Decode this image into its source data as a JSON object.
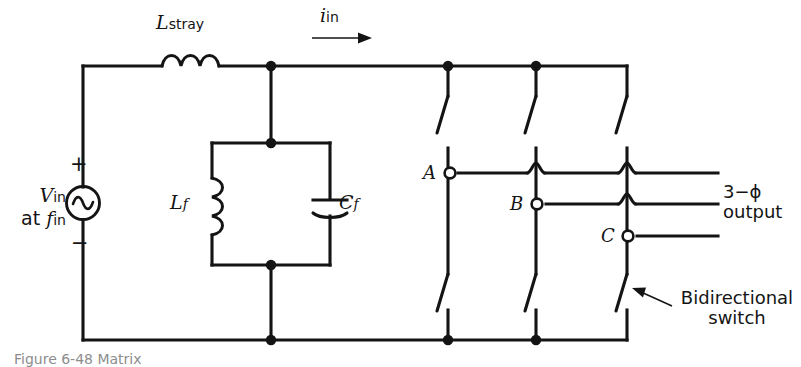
{
  "figure": {
    "caption_fragment": "Figure 6-48  Matrix",
    "background_color": "#ffffff",
    "ink_color": "#141414"
  },
  "source": {
    "symbol": "ac-source-sine",
    "voltage_label": "V",
    "voltage_subscript": "in",
    "frequency_prefix": "at",
    "frequency_label": "f",
    "frequency_subscript": "in",
    "plus_sign": "+",
    "minus_sign": "−"
  },
  "components": {
    "stray_inductor": {
      "symbol": "inductor",
      "label": "L",
      "subscript": "stray"
    },
    "filter_inductor": {
      "symbol": "inductor",
      "label": "L",
      "subscript": "f"
    },
    "filter_capacitor": {
      "symbol": "capacitor",
      "label": "C",
      "subscript": "f"
    }
  },
  "current": {
    "label": "i",
    "subscript": "in",
    "direction": "right"
  },
  "output": {
    "phases": [
      {
        "name": "A",
        "label": "A"
      },
      {
        "name": "B",
        "label": "B"
      },
      {
        "name": "C",
        "label": "C"
      }
    ],
    "label_line1": "3−ϕ",
    "label_line2": "output"
  },
  "annotation": {
    "callout_line1": "Bidirectional",
    "callout_line2": "switch",
    "callout_target": "switch-column-c-lower"
  },
  "switch_matrix": {
    "rows": 2,
    "columns": 3,
    "switch_symbol": "bidirectional-switch-blade",
    "column_names": [
      "A",
      "B",
      "C"
    ]
  }
}
